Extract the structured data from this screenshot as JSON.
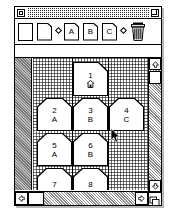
{
  "window": {
    "title": "",
    "close_box": "close-box",
    "zoom_box": "zoom-box"
  },
  "toolbar": {
    "items": [
      {
        "id": "blank-card-tool",
        "icon": "card-plain-icon",
        "label": ""
      },
      {
        "id": "new-card-tool",
        "icon": "card-notched-icon",
        "label": ""
      },
      {
        "id": "separator-1",
        "icon": "diamond-separator-icon",
        "label": ""
      },
      {
        "id": "card-a-tool",
        "icon": "card-notched-icon",
        "label": "A"
      },
      {
        "id": "card-b-tool",
        "icon": "card-notched-icon",
        "label": "B"
      },
      {
        "id": "card-c-tool",
        "icon": "card-notched-icon",
        "label": "C"
      },
      {
        "id": "separator-2",
        "icon": "diamond-separator-icon",
        "label": ""
      },
      {
        "id": "trash-tool",
        "icon": "trash-can-icon",
        "label": ""
      }
    ]
  },
  "message_bar": {
    "text": ""
  },
  "canvas": {
    "cards": [
      {
        "number": "1",
        "label": "",
        "glyph": "home-icon",
        "row": 0,
        "col": 1,
        "notch_left": false,
        "notch_right": true
      },
      {
        "number": "2",
        "label": "A",
        "glyph": "",
        "row": 1,
        "col": 0,
        "notch_left": true,
        "notch_right": true
      },
      {
        "number": "3",
        "label": "B",
        "glyph": "",
        "row": 1,
        "col": 1,
        "notch_left": true,
        "notch_right": true
      },
      {
        "number": "4",
        "label": "C",
        "glyph": "",
        "row": 1,
        "col": 2,
        "notch_left": true,
        "notch_right": true
      },
      {
        "number": "5",
        "label": "A",
        "glyph": "",
        "row": 2,
        "col": 0,
        "notch_left": true,
        "notch_right": true
      },
      {
        "number": "6",
        "label": "B",
        "glyph": "",
        "row": 2,
        "col": 1,
        "notch_left": true,
        "notch_right": true
      },
      {
        "number": "7",
        "label": "",
        "glyph": "",
        "row": 3,
        "col": 0,
        "notch_left": true,
        "notch_right": true
      },
      {
        "number": "8",
        "label": "",
        "glyph": "",
        "row": 3,
        "col": 1,
        "notch_left": true,
        "notch_right": true
      }
    ]
  },
  "scrollbars": {
    "vertical": {
      "up_arrow": "△",
      "down_arrow": "▽",
      "thumb_position_pct": 6
    },
    "horizontal": {
      "left_arrow": "◁",
      "right_arrow": "▷",
      "thumb_position_pct": 4
    },
    "grow_box": "resize-grip-icon"
  },
  "colors": {
    "frame": "#000000",
    "background": "#ffffff",
    "gutter": "#8c8c8c",
    "shadow": "#b9b9b9"
  },
  "cursor": {
    "x": 112,
    "y": 131,
    "type": "arrow-pointer"
  }
}
